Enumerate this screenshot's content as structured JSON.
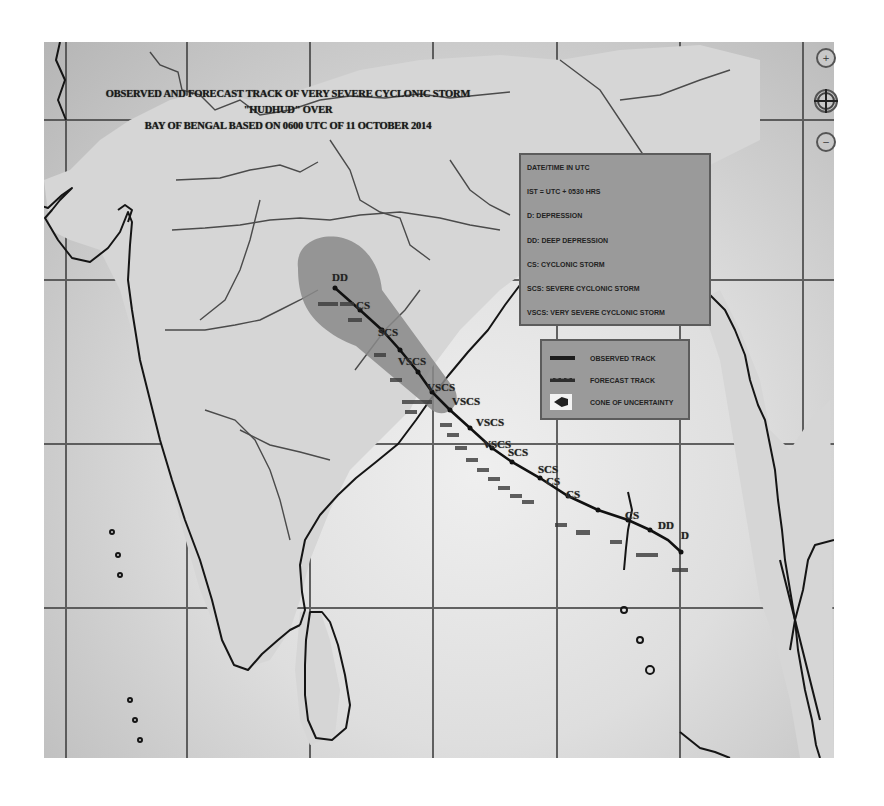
{
  "map": {
    "title_line1": "OBSERVED AND FORECAST TRACK OF VERY SEVERE CYCLONIC STORM \"HUDHUD\" OVER",
    "title_line2": "BAY OF BENGAL BASED ON 0600 UTC OF 11 OCTOBER 2014",
    "colors": {
      "map_background": "#c9c9c9",
      "sea_light": "#efefef",
      "grid_line": "#4a4a4a",
      "coastline": "#111111",
      "cone_of_uncertainty": "#8c8c8c",
      "legend_background": "#9a9a9a",
      "track_line": "#111111"
    }
  },
  "legend_abbreviations": {
    "items": [
      "DATE/TIME IN UTC",
      "IST = UTC + 0530 HRS",
      "D: DEPRESSION",
      "DD: DEEP DEPRESSION",
      "CS: CYCLONIC STORM",
      "SCS: SEVERE CYCLONIC STORM",
      "VSCS: VERY SEVERE CYCLONIC STORM"
    ]
  },
  "legend_tracks": {
    "items": [
      {
        "swatch": "observed",
        "label": "OBSERVED TRACK"
      },
      {
        "swatch": "forecast",
        "label": "FORECAST TRACK"
      },
      {
        "swatch": "cone",
        "label": "CONE OF UNCERTAINTY"
      }
    ]
  },
  "controls": {
    "zoom_in_icon": "+",
    "pan_icon": "✥",
    "zoom_out_icon": "−"
  },
  "track": {
    "category_labels": [
      {
        "text": "DD",
        "x": 332,
        "y": 283
      },
      {
        "text": "CS",
        "x": 356,
        "y": 311
      },
      {
        "text": "SCS",
        "x": 378,
        "y": 338
      },
      {
        "text": "VSCS",
        "x": 398,
        "y": 367
      },
      {
        "text": "VSCS",
        "x": 427,
        "y": 393
      },
      {
        "text": "VSCS",
        "x": 452,
        "y": 407
      },
      {
        "text": "VSCS",
        "x": 476,
        "y": 428
      },
      {
        "text": "VSCS",
        "x": 483,
        "y": 450
      },
      {
        "text": "SCS",
        "x": 508,
        "y": 458
      },
      {
        "text": "SCS",
        "x": 538,
        "y": 475
      },
      {
        "text": "CS",
        "x": 546,
        "y": 487
      },
      {
        "text": "CS",
        "x": 566,
        "y": 500
      },
      {
        "text": "CS",
        "x": 625,
        "y": 521
      },
      {
        "text": "DD",
        "x": 658,
        "y": 531
      },
      {
        "text": "D",
        "x": 681,
        "y": 541
      }
    ],
    "time_labels_count": 22
  }
}
